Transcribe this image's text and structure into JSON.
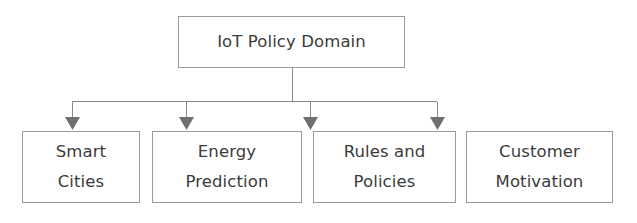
{
  "diagram": {
    "type": "hierarchy-tree",
    "title": "IoT Policy Domain",
    "colors": {
      "box_border": "#9a9a9a",
      "box_fill": "#ffffff",
      "text": "#3b3b3b",
      "connector": "#8a8a8a",
      "arrowhead": "#6f6f6f",
      "background": "#ffffff"
    },
    "root": {
      "label": "IoT Policy Domain"
    },
    "children": [
      {
        "label": "Smart\nCities"
      },
      {
        "label": "Energy\nPrediction"
      },
      {
        "label": "Rules and\nPolicies"
      },
      {
        "label": "Customer\nMotivation"
      }
    ]
  }
}
